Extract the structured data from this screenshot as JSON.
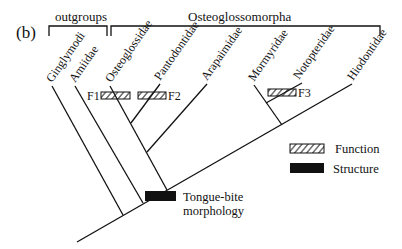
{
  "figure": {
    "panel_label": "(b)",
    "groups": {
      "outgroups": "outgroups",
      "ingroup": "Osteoglossomorpha"
    },
    "taxa": [
      "Ginglymodi",
      "Amiidae",
      "Osteoglossidae",
      "Pantodontidae",
      "Arapaimidae",
      "Mormyridae",
      "Notopteridae",
      "Hiodontidae"
    ],
    "function_markers": [
      "F1",
      "F2",
      "F3"
    ],
    "structure_marker_label_line1": "Tongue-bite",
    "structure_marker_label_line2": "morphology",
    "legend": {
      "function": "Function",
      "structure": "Structure"
    },
    "colors": {
      "line": "#111111",
      "structure_fill": "#111111",
      "background": "#ffffff"
    }
  }
}
